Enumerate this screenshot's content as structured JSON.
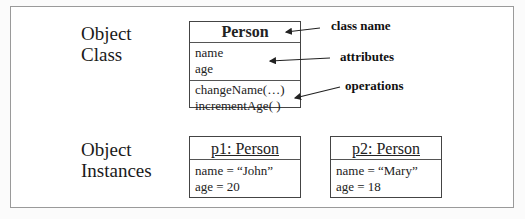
{
  "labels": {
    "object_class": [
      "Object",
      "Class"
    ],
    "object_instances": [
      "Object",
      "Instances"
    ]
  },
  "class_box": {
    "name": "Person",
    "attributes": [
      "name",
      "age"
    ],
    "operations": [
      "changeName(…)",
      "incrementAge( )"
    ]
  },
  "annotations": {
    "class_name": "class name",
    "attributes": "attributes",
    "operations": "operations"
  },
  "instances": [
    {
      "title": "p1: Person",
      "fields": [
        "name = “John”",
        "age = 20"
      ]
    },
    {
      "title": "p2: Person",
      "fields": [
        "name = “Mary”",
        "age = 18"
      ]
    }
  ]
}
